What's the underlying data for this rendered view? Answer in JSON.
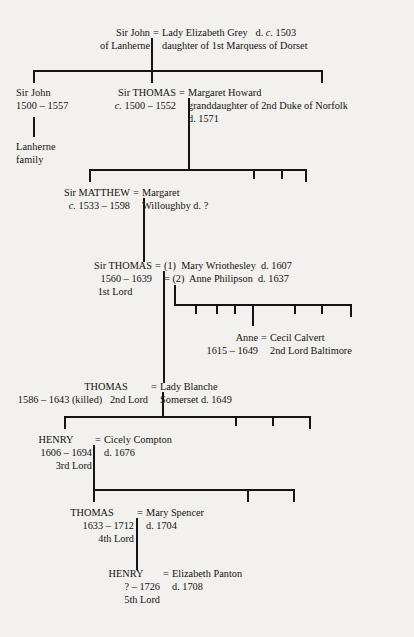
{
  "diagram": {
    "background_color": "#f3f1ee",
    "line_color": "#141414",
    "text_color": "#121212"
  },
  "people": {
    "john_lanherne": {
      "name": "Sir John",
      "line2": "of Lanherne"
    },
    "elizabeth_grey": {
      "name": "Lady Elizabeth Grey",
      "death": "d. c. 1503",
      "death_prefix": "d.",
      "death_circa": "c.",
      "death_year": "1503",
      "line2": "daughter of 1st Marquess of Dorset"
    },
    "john_1500": {
      "name": "Sir John",
      "dates": "1500 – 1557",
      "note1": "Lanherne",
      "note2": "family"
    },
    "thomas_1500": {
      "name": "Sir THOMAS",
      "dates_circa": "c.",
      "dates": "1500 – 1552"
    },
    "margaret_howard": {
      "name": "Margaret Howard",
      "line2": "granddaughter of 2nd Duke of Norfolk",
      "line3": "d. 1571"
    },
    "matthew": {
      "name": "Sir MATTHEW",
      "dates_circa": "c.",
      "dates": "1533 – 1598"
    },
    "margaret_willoughby": {
      "name": "Margaret",
      "line2": "Willoughby  d. ?"
    },
    "thomas_1560": {
      "name": "Sir THOMAS",
      "dates": "1560 – 1639",
      "title": "1st Lord"
    },
    "mary_wriothesley": {
      "marriage_no": "(1)",
      "name": "Mary Wriothesley",
      "death": "d. 1607"
    },
    "anne_philipson": {
      "marriage_no": "(2)",
      "name": "Anne Philipson",
      "death": "d. 1637"
    },
    "anne_arundell": {
      "name": "Anne",
      "dates": "1615 – 1649"
    },
    "cecil_calvert": {
      "name": "Cecil Calvert",
      "title": "2nd Lord Baltimore"
    },
    "thomas_2nd_lord": {
      "name": "THOMAS",
      "dates": "1586 – 1643 (killed)",
      "title": "2nd Lord"
    },
    "lady_blanche": {
      "name": "Lady Blanche",
      "line2": "Somerset  d. 1649"
    },
    "henry_3rd_lord": {
      "name": "HENRY",
      "dates": "1606 – 1694",
      "title": "3rd Lord"
    },
    "cicely_compton": {
      "name": "Cicely Compton",
      "death": "d. 1676"
    },
    "thomas_4th_lord": {
      "name": "THOMAS",
      "dates": "1633 – 1712",
      "title": "4th Lord"
    },
    "mary_spencer": {
      "name": "Mary Spencer",
      "death": "d. 1704"
    },
    "henry_5th_lord": {
      "name": "HENRY",
      "dates": "? – 1726",
      "title": "5th Lord"
    },
    "elizabeth_panton": {
      "name": "Elizabeth Panton",
      "death": "d. 1708"
    }
  },
  "symbols": {
    "marriage": "="
  }
}
